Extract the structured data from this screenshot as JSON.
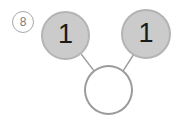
{
  "problem": {
    "index_label": "8",
    "index_label_style": "circled-number"
  },
  "diagram": {
    "type": "number-bond",
    "orientation": "parts-above-whole-below",
    "nodes": [
      {
        "id": "left-part",
        "role": "part",
        "value": "1",
        "filled": true,
        "fill_color": "#cbcbcb",
        "border_color": "#b4b4b4"
      },
      {
        "id": "right-part",
        "role": "part",
        "value": "1",
        "filled": true,
        "fill_color": "#cbcbcb",
        "border_color": "#b4b4b4"
      },
      {
        "id": "whole",
        "role": "whole",
        "value": "",
        "filled": false,
        "fill_color": "#ffffff",
        "border_color": "#9b9b9b"
      }
    ],
    "edges": [
      {
        "from": "left-part",
        "to": "whole",
        "color": "#a0a0a0"
      },
      {
        "from": "right-part",
        "to": "whole",
        "color": "#a0a0a0"
      }
    ],
    "background_color": "#ffffff"
  }
}
